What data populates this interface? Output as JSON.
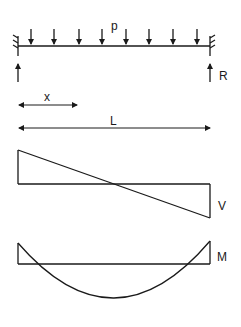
{
  "diagram": {
    "beam": {
      "load_label": "p",
      "reaction_label": "R",
      "load_arrow_count": 8
    },
    "dimensions": {
      "position_label": "x",
      "length_label": "L"
    },
    "shear_diagram": {
      "label": "V"
    },
    "moment_diagram": {
      "label": "M"
    },
    "colors": {
      "line": "#1a1a1a",
      "background": "#ffffff"
    }
  }
}
